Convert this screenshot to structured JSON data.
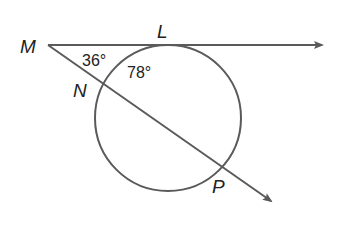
{
  "diagram": {
    "type": "circle-secant-tangent",
    "points": {
      "M": {
        "label": "M",
        "x": 48,
        "y": 45
      },
      "L": {
        "label": "L",
        "x": 166,
        "y": 45
      },
      "N": {
        "label": "N",
        "x": 99,
        "y": 86
      },
      "P": {
        "label": "P",
        "x": 222,
        "y": 167
      }
    },
    "circle": {
      "cx": 168,
      "cy": 118,
      "r": 73
    },
    "angles": [
      {
        "id": "angle-m",
        "label": "36°"
      },
      {
        "id": "arc-ln",
        "label": "78°"
      }
    ],
    "colors": {
      "line": "#5a5a5a",
      "text": "#222222"
    }
  }
}
